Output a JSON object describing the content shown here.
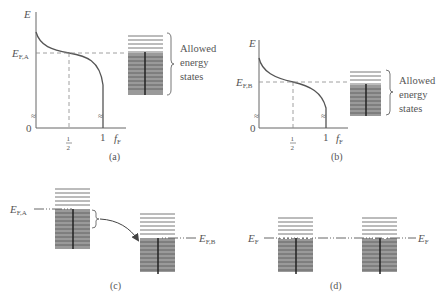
{
  "panels": {
    "a": {
      "caption": "(a)",
      "y_axis_label": "E",
      "x_axis_label": "f",
      "x_axis_sub": "F",
      "fermi_label": "E",
      "fermi_sub": "F,A",
      "origin_label": "0",
      "tick_half_num": "1",
      "tick_half_den": "2",
      "tick_one": "1",
      "bracket_text": [
        "Allowed",
        "energy",
        "states"
      ]
    },
    "b": {
      "caption": "(b)",
      "y_axis_label": "E",
      "x_axis_label": "f",
      "x_axis_sub": "F",
      "fermi_label": "E",
      "fermi_sub": "F,B",
      "origin_label": "0",
      "tick_half_num": "1",
      "tick_half_den": "2",
      "tick_one": "1",
      "bracket_text": [
        "Allowed",
        "energy",
        "states"
      ]
    },
    "c": {
      "caption": "(c)",
      "left_label": "E",
      "left_sub": "F,A",
      "right_label": "E",
      "right_sub": "F,B"
    },
    "d": {
      "caption": "(d)",
      "left_label": "E",
      "left_sub": "F",
      "right_label": "E",
      "right_sub": "F"
    }
  },
  "colors": {
    "line": "#555555",
    "filled_band": "#9a9a9a",
    "electron_dot": "#222222"
  }
}
